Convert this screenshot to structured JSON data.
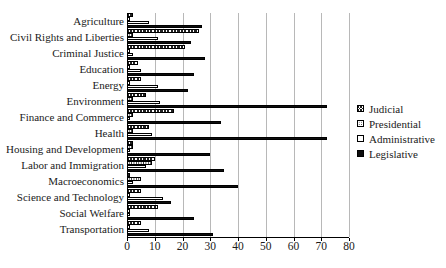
{
  "chart_data": {
    "type": "bar",
    "orientation": "horizontal",
    "title": "",
    "xlabel": "",
    "ylabel": "",
    "xlim": [
      0,
      80
    ],
    "x_ticks": [
      0,
      10,
      20,
      30,
      40,
      50,
      60,
      70,
      80
    ],
    "grid": true,
    "legend_position": "right",
    "categories": [
      "Agriculture",
      "Civil Rights and Liberties",
      "Criminal Justice",
      "Education",
      "Energy",
      "Environment",
      "Finance and Commerce",
      "Health",
      "Housing and Development",
      "Labor and Immigration",
      "Macroeconomics",
      "Science and Technology",
      "Social Welfare",
      "Transportation"
    ],
    "series": [
      {
        "name": "Judicial",
        "pattern": "crosshatch",
        "values": [
          2,
          26,
          21,
          4,
          5,
          7,
          17,
          8,
          2,
          10,
          1,
          5,
          11,
          5
        ]
      },
      {
        "name": "Presidential",
        "pattern": "dots",
        "values": [
          1,
          2,
          1,
          1,
          1,
          2,
          2,
          2,
          2,
          9,
          5,
          1,
          1,
          1
        ]
      },
      {
        "name": "Administrative",
        "pattern": "white",
        "values": [
          8,
          11,
          2,
          5,
          11,
          12,
          1,
          9,
          1,
          7,
          2,
          13,
          1,
          8
        ]
      },
      {
        "name": "Legislative",
        "pattern": "solid",
        "values": [
          27,
          23,
          28,
          24,
          22,
          72,
          34,
          72,
          30,
          35,
          40,
          16,
          24,
          31
        ]
      }
    ],
    "colors": {
      "legislative_fill": "#0d0d0d",
      "grid": "#b8b8b8",
      "axis": "#000000",
      "text": "#1a1a1a"
    }
  }
}
